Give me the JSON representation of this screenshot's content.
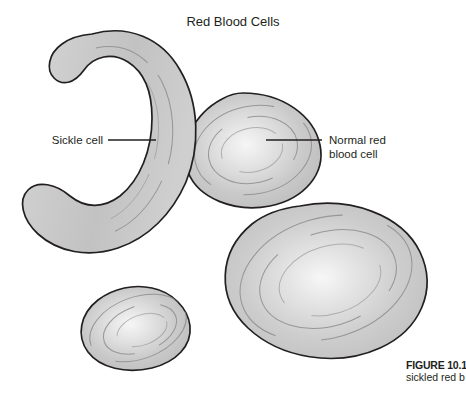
{
  "figure": {
    "title": "Red Blood Cells",
    "caption_number": "FIGURE 10.1",
    "caption_text": "sickled red b",
    "background_color": "#ffffff",
    "ink_color": "#231f20",
    "cell_fill_color": "#c5c5c5",
    "cell_highlight_color": "#f2f2f2",
    "ring_color": "#8d8d8d"
  },
  "labels": {
    "sickle": {
      "line1": "Sickle cell",
      "line2": ""
    },
    "normal": {
      "line1": "Normal red",
      "line2": "blood cell"
    }
  },
  "cells": [
    {
      "name": "sickle-cell",
      "shape": "crescent",
      "label": "Sickle cell",
      "position": "upper-left"
    },
    {
      "name": "normal-red-blood-cell-upper",
      "shape": "biconcave-disc",
      "label": "Normal red blood cell",
      "position": "upper-center-right"
    },
    {
      "name": "normal-red-blood-cell-large",
      "shape": "biconcave-disc",
      "label": "",
      "position": "center-right"
    },
    {
      "name": "normal-red-blood-cell-small",
      "shape": "biconcave-disc",
      "label": "",
      "position": "lower-left"
    }
  ]
}
